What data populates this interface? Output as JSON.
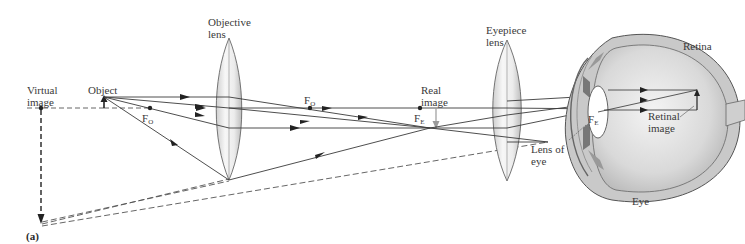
{
  "figure": {
    "panel_label": "(a)"
  },
  "labels": {
    "virtual_image": "Virtual\nimage",
    "object": "Object",
    "objective_lens": "Objective\nlens",
    "eyepiece_lens": "Eyepiece\nlens",
    "real_image": "Real\nimage",
    "retina": "Retina",
    "retinal_image": "Retinal\nimage",
    "lens_of_eye": "Lens of\neye",
    "eye": "Eye",
    "focal_point_objective_left": "F",
    "focal_point_objective_left_sub": "O",
    "focal_point_objective_right": "F",
    "focal_point_objective_right_sub": "O",
    "focal_point_eyepiece_left": "F",
    "focal_point_eyepiece_left_sub": "E",
    "focal_point_eyepiece_right": "F",
    "focal_point_eyepiece_right_sub": "E"
  },
  "colors": {
    "ray": "#3a3a3a",
    "dashed": "#555555",
    "lens_fill": "#e6e6e6",
    "eye_fill": "#d8d8d8",
    "real_image_arrow": "#9a9a9a"
  }
}
